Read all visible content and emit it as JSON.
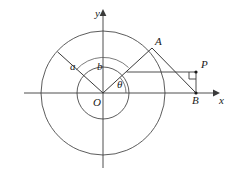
{
  "figure": {
    "type": "geometry-diagram",
    "width": 229,
    "height": 181,
    "background_color": "#ffffff",
    "stroke_color": "#3a3a3a",
    "label_color": "#1a1a1a"
  },
  "axes": {
    "origin_label": "O",
    "x_label": "x",
    "y_label": "y",
    "origin": {
      "x": 103,
      "y": 93
    },
    "x_axis": {
      "x1": 24,
      "y1": 93,
      "x2": 216,
      "y2": 93
    },
    "y_axis": {
      "x1": 103,
      "y1": 12,
      "x2": 103,
      "y2": 168
    }
  },
  "circles": [
    {
      "name": "outer-circle",
      "cx": 103,
      "cy": 93,
      "r": 62,
      "radius_label": "a"
    },
    {
      "name": "inner-circle",
      "cx": 103,
      "cy": 93,
      "r": 26,
      "radius_label": "b"
    }
  ],
  "points": [
    {
      "name": "O",
      "label": "O",
      "x": 103,
      "y": 93,
      "label_x": 94,
      "label_y": 97,
      "dot": false
    },
    {
      "name": "A",
      "label": "A",
      "x": 152,
      "y": 48,
      "label_x": 155,
      "label_y": 36,
      "dot": false
    },
    {
      "name": "P",
      "label": "P",
      "x": 196,
      "y": 72,
      "label_x": 200,
      "label_y": 60,
      "dot": true
    },
    {
      "name": "B",
      "label": "B",
      "x": 196,
      "y": 93,
      "label_x": 192,
      "label_y": 96,
      "dot": true
    }
  ],
  "segments": [
    {
      "name": "ray-a",
      "x1": 103,
      "y1": 93,
      "x2": 58,
      "y2": 52
    },
    {
      "name": "ray-OA",
      "x1": 103,
      "y1": 93,
      "x2": 152,
      "y2": 48
    },
    {
      "name": "segment-AB",
      "x1": 152,
      "y1": 48,
      "x2": 196,
      "y2": 93
    },
    {
      "name": "segment-horizontal-to-P",
      "x1": 127,
      "y1": 72,
      "x2": 196,
      "y2": 72
    },
    {
      "name": "segment-PB",
      "x1": 196,
      "y1": 72,
      "x2": 196,
      "y2": 93
    }
  ],
  "labels": {
    "a": "a",
    "b": "b",
    "theta": "θ",
    "a_pos": {
      "x": 71,
      "y": 62
    },
    "b_pos": {
      "x": 97,
      "y": 62
    },
    "theta_pos": {
      "x": 117,
      "y": 80
    }
  },
  "angle_arcs": [
    {
      "name": "angle-b-arc",
      "cx": 103,
      "cy": 93,
      "r": 36,
      "from_deg": 45,
      "to_deg": 138
    },
    {
      "name": "angle-theta-arc",
      "cx": 103,
      "cy": 93,
      "r": 23,
      "from_deg": 0,
      "to_deg": 42
    }
  ],
  "right_angle": {
    "name": "right-angle-marker-at-P",
    "x": 196,
    "y": 72,
    "size": 7
  }
}
